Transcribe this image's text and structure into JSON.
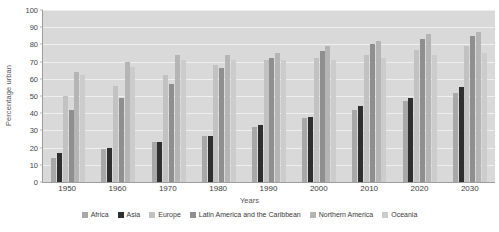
{
  "chart_data": {
    "type": "bar",
    "title": "",
    "xlabel": "Years",
    "ylabel": "Percentage urban",
    "categories": [
      "1950",
      "1960",
      "1970",
      "1980",
      "1990",
      "2000",
      "2010",
      "2020",
      "2030"
    ],
    "ylim": [
      0,
      100
    ],
    "yticks": [
      0,
      10,
      20,
      30,
      40,
      50,
      60,
      70,
      80,
      90,
      100
    ],
    "grid": true,
    "legend_position": "bottom",
    "series": [
      {
        "name": "Africa",
        "color": "#a8a8a8",
        "values": [
          14,
          19,
          23,
          27,
          32,
          37,
          42,
          47,
          52
        ]
      },
      {
        "name": "Asia",
        "color": "#2f2f2f",
        "values": [
          17,
          20,
          23,
          27,
          33,
          38,
          44,
          49,
          55
        ]
      },
      {
        "name": "Europe",
        "color": "#c2c2c2",
        "values": [
          50,
          56,
          62,
          68,
          71,
          72,
          74,
          77,
          79
        ]
      },
      {
        "name": "Latin America and the Caribbean",
        "color": "#8f8f8f",
        "values": [
          42,
          49,
          57,
          66,
          72,
          76,
          80,
          83,
          85
        ]
      },
      {
        "name": "Northern America",
        "color": "#b5b5b5",
        "values": [
          64,
          70,
          74,
          74,
          75,
          79,
          82,
          86,
          87
        ]
      },
      {
        "name": "Oceania",
        "color": "#cccccc",
        "values": [
          62,
          67,
          71,
          71,
          71,
          71,
          72,
          74,
          75
        ]
      }
    ]
  }
}
